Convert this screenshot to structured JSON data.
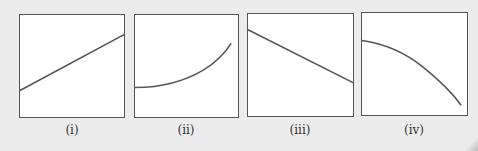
{
  "figure": {
    "panels": [
      {
        "id": "i",
        "label": "(i)",
        "shape": "straight line increasing"
      },
      {
        "id": "ii",
        "label": "(ii)",
        "shape": "concave-up curve increasing"
      },
      {
        "id": "iii",
        "label": "(iii)",
        "shape": "straight line decreasing"
      },
      {
        "id": "iv",
        "label": "(iv)",
        "shape": "concave-down curve decreasing"
      }
    ]
  },
  "colors": {
    "background": "#ececec",
    "panel": "#ffffff",
    "line": "#555555"
  }
}
